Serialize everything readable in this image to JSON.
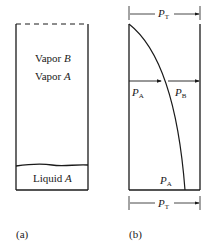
{
  "panel_a": {
    "caption": "(a)",
    "vapor_b_prefix": "Vapor ",
    "vapor_b_var": "B",
    "vapor_a_prefix": "Vapor ",
    "vapor_a_var": "A",
    "liquid_prefix": "Liquid ",
    "liquid_var": "A"
  },
  "panel_b": {
    "caption": "(b)",
    "top_arrow": {
      "var": "P",
      "sub": "T"
    },
    "bottom_arrow": {
      "var": "P",
      "sub": "T"
    },
    "middle_left": {
      "var": "P",
      "sub": "A"
    },
    "middle_right": {
      "var": "P",
      "sub": "B"
    },
    "bottom_label": {
      "var": "P",
      "sub": "A"
    }
  },
  "colors": {
    "line": "#1a1a1a",
    "background": "#ffffff"
  }
}
